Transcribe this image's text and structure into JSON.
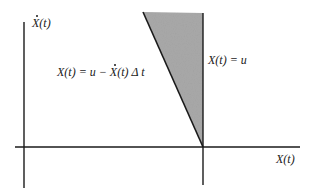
{
  "diagram": {
    "y_axis_label": {
      "dot_symbol": "X",
      "rest": "(t)"
    },
    "x_axis_label": "X(t)",
    "boundary_vertical_label": "X(t) = u",
    "boundary_slanted_label": {
      "lhs": "X(t) = u − ",
      "dot_symbol": "X",
      "rhs": "(t) Δ t"
    },
    "colors": {
      "axis": "#1a1a1a",
      "shaded_region": "#a9a9a9",
      "background": "#ffffff"
    }
  }
}
